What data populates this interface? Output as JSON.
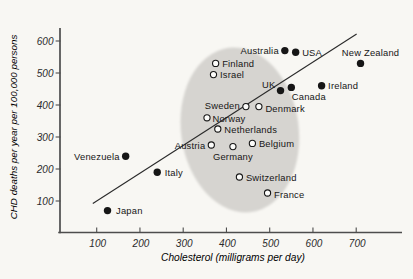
{
  "figure": {
    "background": "#f8f7f3",
    "ink": "#161616",
    "axis_color": "#4d4d4d",
    "tick_label_color": "#2b2b2b",
    "ellipse_fill": "#d6d4d0",
    "trend_line_color": "#2a2a2a"
  },
  "chart_data": {
    "type": "scatter",
    "title": "",
    "xlabel": "Cholesterol (milligrams per day)",
    "ylabel": "CHD deaths per year per 100,000 persons",
    "xlim": [
      0,
      810
    ],
    "ylim": [
      0,
      660
    ],
    "x_ticks": [
      100,
      200,
      300,
      400,
      500,
      600,
      700
    ],
    "y_ticks": [
      100,
      200,
      300,
      400,
      500,
      600
    ],
    "grid": false,
    "legend": "none",
    "marker_legend": {
      "filled": "non-shaded countries",
      "open": "countries inside shaded cluster"
    },
    "cluster_ellipse": {
      "cx": 431,
      "cy": 322,
      "rx": 136,
      "ry": 259,
      "rotation_deg": -8
    },
    "trend_line": {
      "x1": 91,
      "y1": 92,
      "x2": 701,
      "y2": 622
    },
    "points": [
      {
        "country": "Japan",
        "x": 125,
        "y": 70,
        "marker": "filled",
        "label_side": "right",
        "dx": 2
      },
      {
        "country": "Venezuela",
        "x": 167,
        "y": 240,
        "marker": "filled",
        "label_side": "left"
      },
      {
        "country": "Italy",
        "x": 240,
        "y": 190,
        "marker": "filled",
        "label_side": "right",
        "dx": 1
      },
      {
        "country": "Austria",
        "x": 365,
        "y": 275,
        "marker": "open",
        "label_side": "left"
      },
      {
        "country": "Norway",
        "x": 355,
        "y": 360,
        "marker": "open",
        "label_side": "right",
        "dx": -1,
        "dy": 1
      },
      {
        "country": "Netherlands",
        "x": 380,
        "y": 325,
        "marker": "open",
        "label_side": "right"
      },
      {
        "country": "Germany",
        "x": 415,
        "y": 270,
        "marker": "open",
        "label_side": "below"
      },
      {
        "country": "Belgium",
        "x": 460,
        "y": 280,
        "marker": "open",
        "label_side": "right"
      },
      {
        "country": "Switzerland",
        "x": 430,
        "y": 175,
        "marker": "open",
        "label_side": "right"
      },
      {
        "country": "France",
        "x": 495,
        "y": 125,
        "marker": "open",
        "label_side": "right",
        "dy": 1
      },
      {
        "country": "Sweden",
        "x": 445,
        "y": 395,
        "marker": "open",
        "label_side": "left",
        "dy": -1
      },
      {
        "country": "Denmark",
        "x": 475,
        "y": 395,
        "marker": "open",
        "label_side": "right",
        "dy": 2
      },
      {
        "country": "Finland",
        "x": 375,
        "y": 530,
        "marker": "open",
        "label_side": "right"
      },
      {
        "country": "Israel",
        "x": 370,
        "y": 495,
        "marker": "open",
        "label_side": "right"
      },
      {
        "country": "UK",
        "x": 525,
        "y": 445,
        "marker": "filled",
        "label_side": "above-left"
      },
      {
        "country": "Canada",
        "x": 550,
        "y": 455,
        "marker": "filled",
        "label_side": "below-right"
      },
      {
        "country": "Ireland",
        "x": 620,
        "y": 460,
        "marker": "filled",
        "label_side": "right"
      },
      {
        "country": "Australia",
        "x": 535,
        "y": 570,
        "marker": "filled",
        "label_side": "left"
      },
      {
        "country": "USA",
        "x": 560,
        "y": 565,
        "marker": "filled",
        "label_side": "right"
      },
      {
        "country": "New Zealand",
        "x": 710,
        "y": 530,
        "marker": "filled",
        "label_side": "above",
        "dx": 10
      }
    ]
  }
}
